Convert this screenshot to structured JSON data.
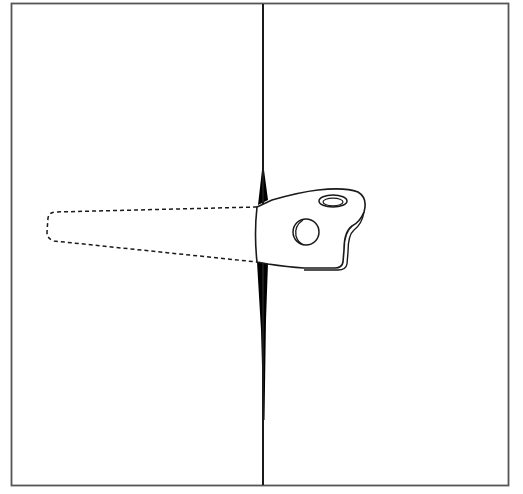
{
  "figure": {
    "colors": {
      "line": "#1a1a1a",
      "frame": "#555555",
      "fill": "#ffffff",
      "slit": "#000000"
    },
    "frame": {
      "x": 11,
      "y": 3,
      "width": 497,
      "height": 482
    },
    "divider_x": 263,
    "parts": [
      {
        "name": "wall-panel-left",
        "visible": true
      },
      {
        "name": "wall-panel-right",
        "visible": true
      },
      {
        "name": "slit-opening",
        "visible": true
      },
      {
        "name": "bracket-visible-portion",
        "visible": true
      },
      {
        "name": "bracket-hidden-portion",
        "style": "dashed"
      },
      {
        "name": "mounting-hole-top",
        "visible": true
      },
      {
        "name": "mounting-hole-side",
        "visible": true
      }
    ]
  }
}
